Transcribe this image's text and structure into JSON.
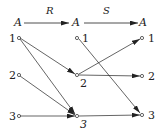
{
  "diagram": {
    "type": "relation-composition",
    "relations": [
      {
        "name": "R",
        "from": "A",
        "to": "A"
      },
      {
        "name": "S",
        "from": "A",
        "to": "A"
      }
    ],
    "sets": [
      "A",
      "A",
      "A"
    ],
    "elements": [
      "1",
      "2",
      "3"
    ],
    "labels": {
      "set_left": "A",
      "set_middle": "A",
      "set_right": "A",
      "rel_R": "R",
      "rel_S": "S",
      "left_1": "1",
      "left_2": "2",
      "left_3": "3",
      "mid_1": "1",
      "mid_2": "2",
      "mid_3": "3",
      "right_1": "1",
      "right_2": "2",
      "right_3": "3"
    },
    "edges_R": [
      {
        "from": "1",
        "to": "2"
      },
      {
        "from": "1",
        "to": "3"
      },
      {
        "from": "2",
        "to": "3"
      },
      {
        "from": "3",
        "to": "3"
      }
    ],
    "edges_S": [
      {
        "from": "1",
        "to": "3"
      },
      {
        "from": "2",
        "to": "1"
      },
      {
        "from": "2",
        "to": "2"
      },
      {
        "from": "3",
        "to": "3"
      }
    ],
    "colors": {
      "stroke": "#222222",
      "background": "#ffffff"
    }
  }
}
